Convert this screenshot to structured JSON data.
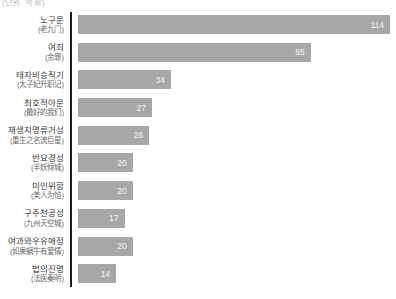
{
  "unit_note": "(단위: 억 회)",
  "colors": {
    "bar": "#a7a7a7",
    "value_label": "#f5f5f5",
    "label_primary": "#3a3a3a",
    "label_secondary": "#6a6a6a",
    "axis": "#1c1c1c",
    "background": "#ffffff"
  },
  "chart_data": {
    "type": "bar",
    "orientation": "horizontal",
    "title": "",
    "xlabel": "",
    "ylabel": "",
    "xlim": [
      0,
      116
    ],
    "grid": false,
    "legend": "none",
    "value_labels": "inside-end",
    "categories": [
      "노구문 (老九门)",
      "여죄 (余罪)",
      "태자비승직기 (太子妃升职记)",
      "최호적아문 (最好的我们)",
      "재생지명류거성 (重生之名流巨星)",
      "반요경성 (半妖倾城)",
      "미인위함 (美人为馅)",
      "구주천공성 (九州天空城)",
      "여과와우유애정 (如果蜗牛有爱情)",
      "법의진명 (法医秦明)"
    ],
    "values": [
      114,
      85,
      34,
      27,
      26,
      20,
      20,
      17,
      20,
      14
    ],
    "max_value": 114,
    "rows": [
      {
        "label": "노구문",
        "sub": "(老九门)",
        "value": "114",
        "num": 114
      },
      {
        "label": "여죄",
        "sub": "(余罪)",
        "value": "85",
        "num": 85
      },
      {
        "label": "태자비승직기",
        "sub": "(太子妃升职记)",
        "value": "34",
        "num": 34
      },
      {
        "label": "최호적아문",
        "sub": "(最好的我们)",
        "value": "27",
        "num": 27
      },
      {
        "label": "재생지명류거성",
        "sub": "(重生之名流巨星)",
        "value": "26",
        "num": 26
      },
      {
        "label": "반요경성",
        "sub": "(半妖倾城)",
        "value": "20",
        "num": 20
      },
      {
        "label": "미인위함",
        "sub": "(美人为馅)",
        "value": "20",
        "num": 20
      },
      {
        "label": "구주천공성",
        "sub": "(九州天空城)",
        "value": "17",
        "num": 17
      },
      {
        "label": "여과와우유애정",
        "sub": "(如果蜗牛有爱情)",
        "value": "20",
        "num": 20
      },
      {
        "label": "법의진명",
        "sub": "(法医秦明)",
        "value": "14",
        "num": 14
      }
    ]
  }
}
